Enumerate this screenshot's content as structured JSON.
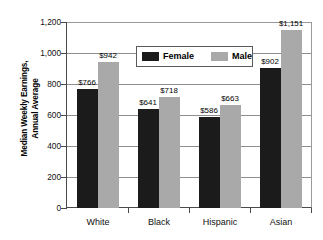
{
  "chart_data": {
    "type": "bar",
    "title": "",
    "subtitle": "",
    "xlabel": "",
    "ylabel": "Median Weekly Earnings, Annual Average",
    "ylabel_lines": [
      "Median Weekly Earnings,",
      "Annual Average"
    ],
    "categories": [
      "White",
      "Black",
      "Hispanic",
      "Asian"
    ],
    "series": [
      {
        "name": "Female",
        "color": "#1b1b1b",
        "values": [
          766,
          641,
          586,
          902
        ],
        "labels": [
          "$766",
          "$641",
          "$586",
          "$902"
        ]
      },
      {
        "name": "Male",
        "color": "#a9a9a9",
        "values": [
          942,
          718,
          663,
          1151
        ],
        "labels": [
          "$942",
          "$718",
          "$663",
          "$1,151"
        ]
      }
    ],
    "ylim": [
      0,
      1200
    ],
    "yticks": [
      0,
      200,
      400,
      600,
      800,
      1000,
      1200
    ],
    "ytick_labels": [
      "0",
      "200",
      "400",
      "600",
      "800",
      "1,000",
      "1,200"
    ],
    "grid": true,
    "grid_axis": "y",
    "legend_position": "upper-center",
    "legend_entries": [
      "Female",
      "Male"
    ]
  }
}
